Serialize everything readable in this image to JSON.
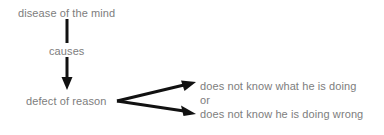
{
  "diagram": {
    "type": "flow-diagram",
    "title": "disease of the mind causes defect of reason",
    "colors": {
      "background": "#ffffff",
      "text": "#7d7d7d",
      "arrow": "#111111"
    },
    "nodes": {
      "cause": "disease of the mind",
      "relation": "causes",
      "effect": "defect of reason"
    },
    "outcomes": [
      {
        "label": "does not know what he is doing"
      },
      {
        "label": "or"
      },
      {
        "label": "does not know he is doing wrong"
      }
    ],
    "edges": [
      {
        "name": "causes-arrow",
        "from": "disease of the mind",
        "to": "defect of reason",
        "direction": "down"
      },
      {
        "name": "outcome-arrow-upper",
        "from": "defect of reason",
        "to": "does not know what he is doing",
        "direction": "up-right"
      },
      {
        "name": "outcome-arrow-lower",
        "from": "defect of reason",
        "to": "does not know he is doing wrong",
        "direction": "down-right"
      }
    ]
  }
}
